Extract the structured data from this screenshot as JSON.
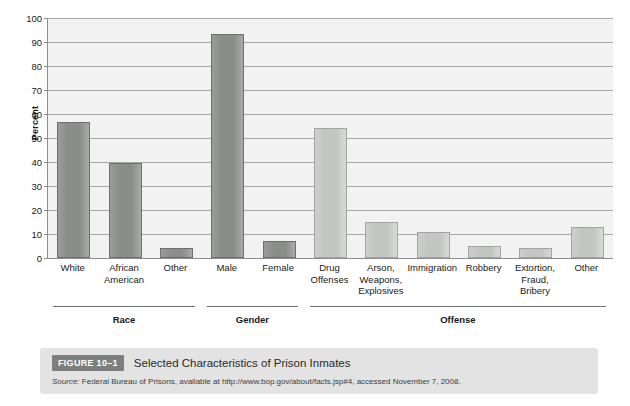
{
  "figure": {
    "badge": "FIGURE 10–1",
    "title": "Selected Characteristics of Prison Inmates",
    "source_prefix": "Source:",
    "source_text": " Federal Bureau of Prisons, available at http://www.bop.gov/about/facts.jsp#4, accessed November 7, 2008."
  },
  "colors": {
    "bar_dark": "#8b8d8b",
    "bar_light": "#c3c5c3",
    "plot_background": "#f1f2f1",
    "gridline": "#a6a8a6",
    "axis": "#8d8d8d",
    "caption_band": "#e2e3e2",
    "badge": "#7d7f7d"
  },
  "chart_data": {
    "type": "bar",
    "title": "Selected Characteristics of Prison Inmates",
    "xlabel": "",
    "ylabel": "Percent",
    "ylim": [
      0,
      100
    ],
    "yticks": [
      0,
      10,
      20,
      30,
      40,
      50,
      60,
      70,
      80,
      90,
      100
    ],
    "grid": true,
    "legend": "none",
    "categories": [
      "White",
      "African American",
      "Other",
      "Male",
      "Female",
      "Drug Offenses",
      "Arson, Weapons, Explosives",
      "Immigration",
      "Robbery",
      "Extortion, Fraud, Bribery",
      "Other"
    ],
    "values": [
      56.5,
      39.5,
      4,
      93.5,
      7,
      54,
      15,
      11,
      5,
      4,
      13
    ],
    "bars": [
      {
        "label_lines": [
          "White"
        ],
        "value": 56.5,
        "group": "Race",
        "shade": "dark"
      },
      {
        "label_lines": [
          "African",
          "American"
        ],
        "value": 39.5,
        "group": "Race",
        "shade": "dark"
      },
      {
        "label_lines": [
          "Other"
        ],
        "value": 4,
        "group": "Race",
        "shade": "dark"
      },
      {
        "label_lines": [
          "Male"
        ],
        "value": 93.5,
        "group": "Gender",
        "shade": "dark"
      },
      {
        "label_lines": [
          "Female"
        ],
        "value": 7,
        "group": "Gender",
        "shade": "dark"
      },
      {
        "label_lines": [
          "Drug",
          "Offenses"
        ],
        "value": 54,
        "group": "Offense",
        "shade": "light"
      },
      {
        "label_lines": [
          "Arson,",
          "Weapons,",
          "Explosives"
        ],
        "value": 15,
        "group": "Offense",
        "shade": "light"
      },
      {
        "label_lines": [
          "Immigration"
        ],
        "value": 11,
        "group": "Offense",
        "shade": "light"
      },
      {
        "label_lines": [
          "Robbery"
        ],
        "value": 5,
        "group": "Offense",
        "shade": "light"
      },
      {
        "label_lines": [
          "Extortion,",
          "Fraud,",
          "Bribery"
        ],
        "value": 4,
        "group": "Offense",
        "shade": "light"
      },
      {
        "label_lines": [
          "Other"
        ],
        "value": 13,
        "group": "Offense",
        "shade": "light"
      }
    ],
    "groups": [
      {
        "name": "Race",
        "first": 0,
        "last": 2
      },
      {
        "name": "Gender",
        "first": 3,
        "last": 4
      },
      {
        "name": "Offense",
        "first": 5,
        "last": 10
      }
    ]
  }
}
